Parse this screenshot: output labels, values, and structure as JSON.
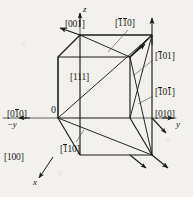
{
  "figure": {
    "background_color": "#f2f1ee",
    "line_color": "#1a1a1a"
  },
  "axes": [
    {
      "name": "z-axis",
      "label": "z",
      "x": 83,
      "y": 7
    },
    {
      "name": "y-axis",
      "label": "y",
      "x": 176,
      "y": 124
    },
    {
      "name": "negative-y-axis",
      "label": "−y",
      "x": 9,
      "y": 124
    },
    {
      "name": "x-axis",
      "label": "x",
      "x": 32,
      "y": 180
    }
  ],
  "origin": {
    "label": "0",
    "x": 52,
    "y": 108
  },
  "direction_labels": [
    {
      "name": "direction-001",
      "prefix": "[",
      "d1": "0",
      "d1bar": false,
      "d2": "0",
      "d2bar": false,
      "d3": "1",
      "d3bar": false,
      "suffix": "]",
      "x": 65,
      "y": 20
    },
    {
      "name": "direction-1bar1bar0",
      "prefix": "[",
      "d1": "1",
      "d1bar": true,
      "d2": "1",
      "d2bar": true,
      "d3": "0",
      "d3bar": false,
      "suffix": "]",
      "x": 115,
      "y": 19
    },
    {
      "name": "direction-1bar01",
      "prefix": "[",
      "d1": "1",
      "d1bar": true,
      "d2": "0",
      "d2bar": false,
      "d3": "1",
      "d3bar": false,
      "suffix": "]",
      "x": 155,
      "y": 52
    },
    {
      "name": "direction-1bar01bar",
      "prefix": "[",
      "d1": "1",
      "d1bar": true,
      "d2": "0",
      "d2bar": false,
      "d3": "1",
      "d3bar": true,
      "suffix": "]",
      "x": 155,
      "y": 88
    },
    {
      "name": "direction-010",
      "prefix": "[",
      "d1": "0",
      "d1bar": false,
      "d2": "1",
      "d2bar": false,
      "d3": "0",
      "d3bar": false,
      "suffix": "]",
      "x": 155,
      "y": 110
    },
    {
      "name": "direction-01bar0",
      "prefix": "[",
      "d1": "0",
      "d1bar": false,
      "d2": "1",
      "d2bar": true,
      "d3": "0",
      "d3bar": false,
      "suffix": "]",
      "x": 7,
      "y": 110
    },
    {
      "name": "direction-100",
      "prefix": "[",
      "d1": "1",
      "d1bar": false,
      "d2": "0",
      "d2bar": false,
      "d3": "0",
      "d3bar": false,
      "suffix": "]",
      "x": 4,
      "y": 153
    },
    {
      "name": "direction-111",
      "prefix": "[",
      "d1": "1",
      "d1bar": false,
      "d2": "1",
      "d2bar": false,
      "d3": "1",
      "d3bar": false,
      "suffix": "]",
      "x": 70,
      "y": 73
    },
    {
      "name": "direction-1bar10",
      "prefix": "[",
      "d1": "1",
      "d1bar": true,
      "d2": "1",
      "d2bar": false,
      "d3": "0",
      "d3bar": false,
      "suffix": "]",
      "x": 60,
      "y": 145
    }
  ],
  "cube": {
    "front_bottom_left": {
      "x": 58,
      "y": 118
    },
    "front_bottom_right": {
      "x": 130,
      "y": 118
    },
    "front_top_left": {
      "x": 58,
      "y": 57
    },
    "front_top_right": {
      "x": 130,
      "y": 57
    },
    "back_bottom_left": {
      "x": 80,
      "y": 155
    },
    "back_bottom_right": {
      "x": 152,
      "y": 155
    },
    "back_top_left": {
      "x": 80,
      "y": 35
    },
    "back_top_right": {
      "x": 152,
      "y": 35
    }
  },
  "vectors": [
    {
      "name": "vector-001-arrow",
      "from": [
        80,
        35
      ],
      "to": [
        52,
        26
      ]
    },
    {
      "name": "vector-111-arrow",
      "from": [
        80,
        155
      ],
      "to": [
        152,
        35
      ]
    },
    {
      "name": "vector-1bar01-arrow",
      "from": [
        152,
        155
      ],
      "to": [
        130,
        57
      ]
    },
    {
      "name": "vector-1bar01bar-arrow",
      "from": [
        80,
        35
      ],
      "to": [
        152,
        155
      ]
    },
    {
      "name": "vector-1bar1bar0-arrow",
      "from": [
        80,
        35
      ],
      "to": [
        152,
        35
      ]
    },
    {
      "name": "vector-1bar10-arrow",
      "from": [
        58,
        118
      ],
      "to": [
        152,
        155
      ]
    },
    {
      "name": "vector-z-arrow",
      "from": [
        152,
        155
      ],
      "to": [
        152,
        20
      ]
    }
  ]
}
